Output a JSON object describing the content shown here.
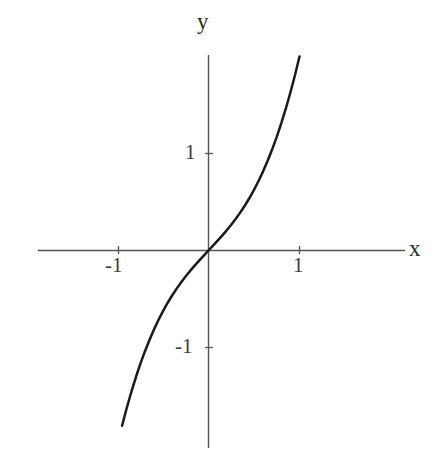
{
  "figure": {
    "background_color": "#ffffff",
    "axis_color": "#555555",
    "curve_color": "#1a1a1a",
    "text_color": "#2b2b2b"
  },
  "labels": {
    "y_axis_title": "y",
    "x_axis_title": "x",
    "x_tick_neg1": "-1",
    "x_tick_pos1": "1",
    "y_tick_pos1": "1",
    "y_tick_neg1": "-1"
  },
  "chart_data": {
    "type": "line",
    "title": "",
    "xlabel": "x",
    "ylabel": "y",
    "xlim": [
      -2.3,
      2.2
    ],
    "ylim": [
      -2.05,
      2.0
    ],
    "grid": false,
    "legend": null,
    "axis_style": "centered-cross",
    "x_ticks": [
      -1,
      1
    ],
    "x_tick_labels": [
      "-1",
      "1"
    ],
    "y_ticks": [
      -1,
      1
    ],
    "y_tick_labels": [
      "-1",
      "1"
    ],
    "series": [
      {
        "name": "y = x + x^3",
        "expression": "x + x**3",
        "x": [
          -0.95,
          -0.9,
          -0.85,
          -0.8,
          -0.75,
          -0.7,
          -0.65,
          -0.6,
          -0.55,
          -0.5,
          -0.45,
          -0.4,
          -0.35,
          -0.3,
          -0.25,
          -0.2,
          -0.15,
          -0.1,
          -0.05,
          0.0,
          0.05,
          0.1,
          0.15,
          0.2,
          0.25,
          0.3,
          0.35,
          0.4,
          0.45,
          0.5,
          0.55,
          0.6,
          0.65,
          0.7,
          0.75,
          0.8,
          0.85,
          0.9,
          0.95,
          1.0
        ],
        "y": [
          -1.807,
          -1.629,
          -1.464,
          -1.312,
          -1.172,
          -1.043,
          -0.925,
          -0.816,
          -0.716,
          -0.625,
          -0.541,
          -0.464,
          -0.393,
          -0.327,
          -0.266,
          -0.208,
          -0.153,
          -0.101,
          -0.05,
          0.0,
          0.05,
          0.101,
          0.153,
          0.208,
          0.266,
          0.327,
          0.393,
          0.464,
          0.541,
          0.625,
          0.716,
          0.816,
          0.925,
          1.043,
          1.172,
          1.312,
          1.464,
          1.629,
          1.807,
          2.0
        ]
      }
    ]
  }
}
